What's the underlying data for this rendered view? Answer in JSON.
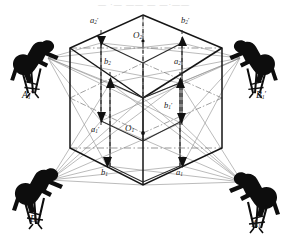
{
  "figure": {
    "title_strip": "— ·— —— — —·——",
    "background_color": "#ffffff",
    "ink_color": "#1a1a1a",
    "ray_color": "#8a8a8a",
    "hidden_edge_color": "#4a4a4a",
    "width": 288,
    "height": 240
  },
  "cube": {
    "name": "isometric-cube",
    "vertices": {
      "top": [
        143,
        15
      ],
      "upper_left": [
        70,
        48
      ],
      "upper_right": [
        222,
        48
      ],
      "front_top": [
        143,
        98
      ],
      "lower_left": [
        70,
        148
      ],
      "lower_right": [
        222,
        148
      ],
      "bottom": [
        143,
        185
      ]
    }
  },
  "centers": [
    {
      "id": "O2",
      "base": "O",
      "sub": "2",
      "prime": "",
      "x": 138,
      "y": 34,
      "marker_x": 143,
      "marker_y": 41
    },
    {
      "id": "O1",
      "base": "O",
      "sub": "1",
      "prime": "",
      "x": 126,
      "y": 126,
      "marker_x": 143,
      "marker_y": 133
    }
  ],
  "points": [
    {
      "id": "a2p",
      "base": "a",
      "sub": "2",
      "prime": "′",
      "x": 93,
      "y": 18,
      "arrow_x": 101,
      "arrow_y": 43,
      "arrow_dir": "down"
    },
    {
      "id": "b2p",
      "base": "b",
      "sub": "2",
      "prime": "′",
      "x": 184,
      "y": 18,
      "arrow_x": 182,
      "arrow_y": 43,
      "arrow_dir": "up"
    },
    {
      "id": "b2",
      "base": "b",
      "sub": "2",
      "prime": "",
      "x": 106,
      "y": 60,
      "arrow_x": 110,
      "arrow_y": 83,
      "arrow_dir": "up"
    },
    {
      "id": "a2",
      "base": "a",
      "sub": "2",
      "prime": "",
      "x": 176,
      "y": 60,
      "arrow_x": 180,
      "arrow_y": 83,
      "arrow_dir": "up"
    },
    {
      "id": "a1p",
      "base": "a",
      "sub": "1",
      "prime": "′",
      "x": 94,
      "y": 128,
      "arrow_x": 101,
      "arrow_y": 121,
      "arrow_dir": "down"
    },
    {
      "id": "b1p",
      "base": "b",
      "sub": "1",
      "prime": "′",
      "x": 166,
      "y": 104,
      "arrow_x": 181,
      "arrow_y": 123,
      "arrow_dir": "down"
    },
    {
      "id": "b1",
      "base": "b",
      "sub": "1",
      "prime": "",
      "x": 103,
      "y": 171,
      "arrow_x": 107,
      "arrow_y": 166,
      "arrow_dir": "down"
    },
    {
      "id": "a1",
      "base": "a",
      "sub": "1",
      "prime": "",
      "x": 178,
      "y": 171,
      "arrow_x": 182,
      "arrow_y": 166,
      "arrow_dir": "down"
    }
  ],
  "cameras": [
    {
      "id": "A1p",
      "base": "A",
      "sub": "1",
      "prime": "′",
      "label_x": 24,
      "label_y": 96,
      "fig_x": 18,
      "fig_y": 40,
      "node_x": 48,
      "node_y": 58,
      "flip": false
    },
    {
      "id": "B1p",
      "base": "B",
      "sub": "1",
      "prime": "′",
      "label_x": 258,
      "label_y": 96,
      "fig_x": 236,
      "fig_y": 40,
      "node_x": 240,
      "node_y": 58,
      "flip": true
    },
    {
      "id": "B1",
      "base": "B",
      "sub": "1",
      "prime": "",
      "label_x": 31,
      "label_y": 219,
      "fig_x": 20,
      "fig_y": 170,
      "node_x": 50,
      "node_y": 180,
      "flip": false
    },
    {
      "id": "A1",
      "base": "A",
      "sub": "1",
      "prime": "",
      "label_x": 254,
      "label_y": 224,
      "fig_x": 240,
      "fig_y": 174,
      "node_x": 242,
      "node_y": 182,
      "flip": true
    }
  ],
  "rays": {
    "description": "sight-lines from each camera node to cube marker points",
    "from_A1p": [
      [
        101,
        43
      ],
      [
        110,
        83
      ],
      [
        101,
        121
      ],
      [
        107,
        166
      ],
      [
        143,
        98
      ],
      [
        182,
        43
      ]
    ],
    "from_B1p": [
      [
        182,
        43
      ],
      [
        180,
        83
      ],
      [
        181,
        123
      ],
      [
        182,
        166
      ],
      [
        143,
        98
      ],
      [
        101,
        43
      ]
    ],
    "from_B1": [
      [
        107,
        166
      ],
      [
        101,
        121
      ],
      [
        110,
        83
      ],
      [
        182,
        166
      ],
      [
        143,
        98
      ],
      [
        143,
        185
      ]
    ],
    "from_A1": [
      [
        182,
        166
      ],
      [
        181,
        123
      ],
      [
        180,
        83
      ],
      [
        107,
        166
      ],
      [
        143,
        98
      ],
      [
        143,
        185
      ]
    ]
  }
}
